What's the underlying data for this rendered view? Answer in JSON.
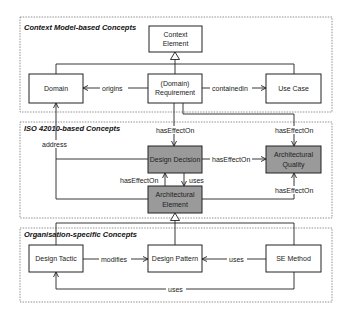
{
  "groups": {
    "context": {
      "title": "Context Model-based Concepts"
    },
    "iso": {
      "title": "ISO 42010-based Concepts"
    },
    "org": {
      "title": "Organisation-specific Concepts"
    }
  },
  "nodes": {
    "context_element": {
      "line1": "Context",
      "line2": "Element",
      "fill": "#ffffff"
    },
    "domain": {
      "label": "Domain",
      "fill": "#ffffff"
    },
    "requirement": {
      "line1": "(Domain)",
      "line2": "Requirement",
      "fill": "#ffffff"
    },
    "use_case": {
      "label": "Use Case",
      "fill": "#ffffff"
    },
    "design_decision": {
      "label": "Design Decision",
      "fill": "#9a9a9a"
    },
    "architectural_quality": {
      "line1": "Architectural",
      "line2": "Quality",
      "fill": "#9a9a9a"
    },
    "architectural_element": {
      "line1": "Architectural",
      "line2": "Element",
      "fill": "#9a9a9a"
    },
    "design_tactic": {
      "label": "Design Tactic",
      "fill": "#ffffff"
    },
    "design_pattern": {
      "label": "Design Pattern",
      "fill": "#ffffff"
    },
    "se_method": {
      "label": "SE Method",
      "fill": "#ffffff"
    }
  },
  "edges": {
    "origins": "origins",
    "containedin": "containedin",
    "address": "address",
    "req_dd": "hasEffectOn",
    "req_aq": "hasEffectOn",
    "dd_aq": "hasEffectOn",
    "ae_dd": "hasEffectOn",
    "dd_ae_uses": "uses",
    "ae_aq": "hasEffectOn",
    "modifies": "modifies",
    "se_dp_uses": "uses",
    "se_dt_uses": "uses"
  }
}
